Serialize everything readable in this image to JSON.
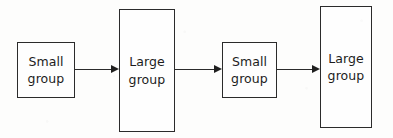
{
  "diagram": {
    "type": "flowchart",
    "orientation": "left-to-right",
    "background_color": "#fdfdfc",
    "stroke_color": "#2b2b2b",
    "text_color": "#1c1c1c",
    "nodes": [
      {
        "id": "node-1",
        "shape": "rectangle",
        "size_class": "small",
        "line1": "Small",
        "line2": "group",
        "x": 17,
        "y": 42,
        "w": 58,
        "h": 56
      },
      {
        "id": "node-2",
        "shape": "rectangle",
        "size_class": "large",
        "line1": "Large",
        "line2": "group",
        "x": 119,
        "y": 9,
        "w": 56,
        "h": 123
      },
      {
        "id": "node-3",
        "shape": "rectangle",
        "size_class": "small",
        "line1": "Small",
        "line2": "group",
        "x": 222,
        "y": 42,
        "w": 55,
        "h": 56
      },
      {
        "id": "node-4",
        "shape": "rectangle",
        "size_class": "large",
        "line1": "Large",
        "line2": "group",
        "x": 320,
        "y": 6,
        "w": 52,
        "h": 122
      }
    ],
    "edges": [
      {
        "id": "edge-1",
        "from": "node-1",
        "to": "node-2",
        "x": 75,
        "y": 69,
        "length": 36,
        "head": "solid-triangle"
      },
      {
        "id": "edge-2",
        "from": "node-2",
        "to": "node-3",
        "x": 175,
        "y": 69,
        "length": 39,
        "head": "solid-triangle"
      },
      {
        "id": "edge-3",
        "from": "node-3",
        "to": "node-4",
        "x": 277,
        "y": 69,
        "length": 35,
        "head": "solid-triangle"
      }
    ]
  }
}
